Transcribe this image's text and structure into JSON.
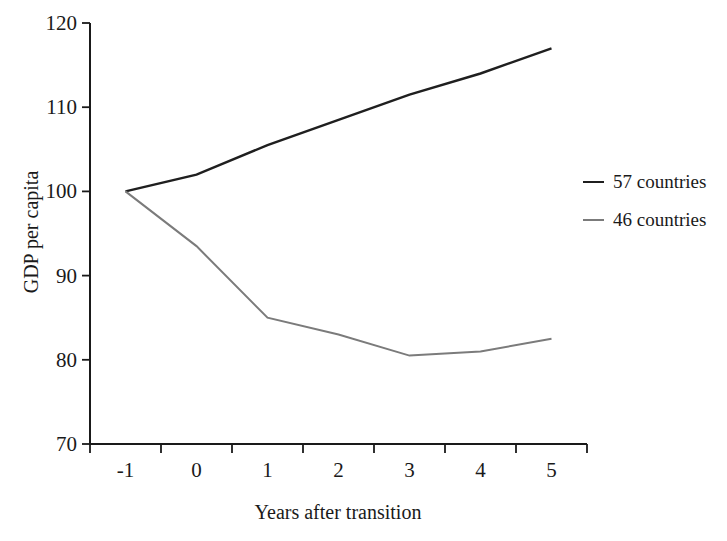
{
  "figure": {
    "background": "#ffffff",
    "text_color": "#1a1a1a",
    "axis_color": "#1a1a1a"
  },
  "chart_data": {
    "type": "line",
    "title": "",
    "xlabel": "Years after transition",
    "ylabel": "GDP per capita",
    "x": [
      -1,
      0,
      1,
      2,
      3,
      4,
      5
    ],
    "x_tick_labels": [
      "-1",
      "0",
      "1",
      "2",
      "3",
      "4",
      "5"
    ],
    "y_ticks": [
      70,
      80,
      90,
      100,
      110,
      120
    ],
    "ylim": [
      70,
      120
    ],
    "grid": false,
    "legend_position": "right",
    "series": [
      {
        "name": "57 countries",
        "color": "#1f1f1f",
        "line_width": 2.4,
        "values": [
          100,
          102,
          105.5,
          108.5,
          111.5,
          114,
          117
        ]
      },
      {
        "name": "46 countries",
        "color": "#7b7b7b",
        "line_width": 2,
        "values": [
          100,
          93.5,
          85,
          83,
          80.5,
          81,
          82.5
        ]
      }
    ]
  }
}
